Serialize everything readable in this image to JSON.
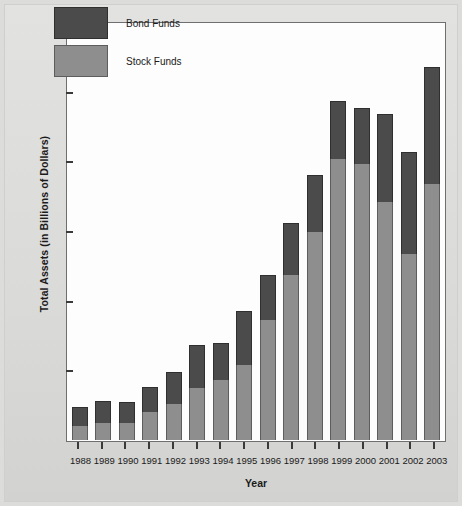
{
  "chart_data": {
    "type": "bar",
    "subtype": "stacked-vertical",
    "title": "",
    "xlabel": "Year",
    "ylabel": "Total Assets (in Billions of Dollars)",
    "ylim": [
      0,
      6000
    ],
    "ytick_values": [
      6000,
      5000,
      4000,
      3000,
      2000,
      1000,
      0
    ],
    "ytick_labels": [
      "6000",
      "5000",
      "4000",
      "3000",
      "2000",
      "1000",
      "0"
    ],
    "grid": false,
    "legend_position": "top-left-inside",
    "categories": [
      "1988",
      "1989",
      "1990",
      "1991",
      "1992",
      "1993",
      "1994",
      "1995",
      "1996",
      "1997",
      "1998",
      "1999",
      "2000",
      "2001",
      "2002",
      "2003"
    ],
    "series": [
      {
        "name": "Stock Funds",
        "color": "#8e8e8e",
        "values": [
          195,
          250,
          245,
          405,
          515,
          750,
          865,
          1070,
          1720,
          2370,
          2980,
          4040,
          3960,
          3420,
          2670,
          3680
        ]
      },
      {
        "name": "Bond Funds",
        "color": "#4b4b4b",
        "values": [
          285,
          310,
          300,
          350,
          465,
          615,
          530,
          775,
          645,
          740,
          830,
          830,
          810,
          1265,
          1470,
          1675
        ]
      }
    ],
    "totals": [
      480,
      560,
      545,
      755,
      980,
      1365,
      1395,
      1845,
      2365,
      3110,
      3810,
      4870,
      4770,
      4685,
      4140,
      5355
    ]
  },
  "legend": {
    "entries": [
      {
        "label": "Bond Funds",
        "color": "#4b4b4b",
        "swatch": "bond"
      },
      {
        "label": "Stock Funds",
        "color": "#8e8e8e",
        "swatch": "stock"
      }
    ]
  },
  "axes": {
    "y_title": "Total Assets (in Billions of Dollars)",
    "x_title": "Year"
  },
  "colors": {
    "bond": "#4b4b4b",
    "stock": "#8e8e8e",
    "plot_background": "#fdfdfd",
    "figure_background": "#dcdcda",
    "axis": "#6f6f6f",
    "text": "#1a1a1a"
  }
}
